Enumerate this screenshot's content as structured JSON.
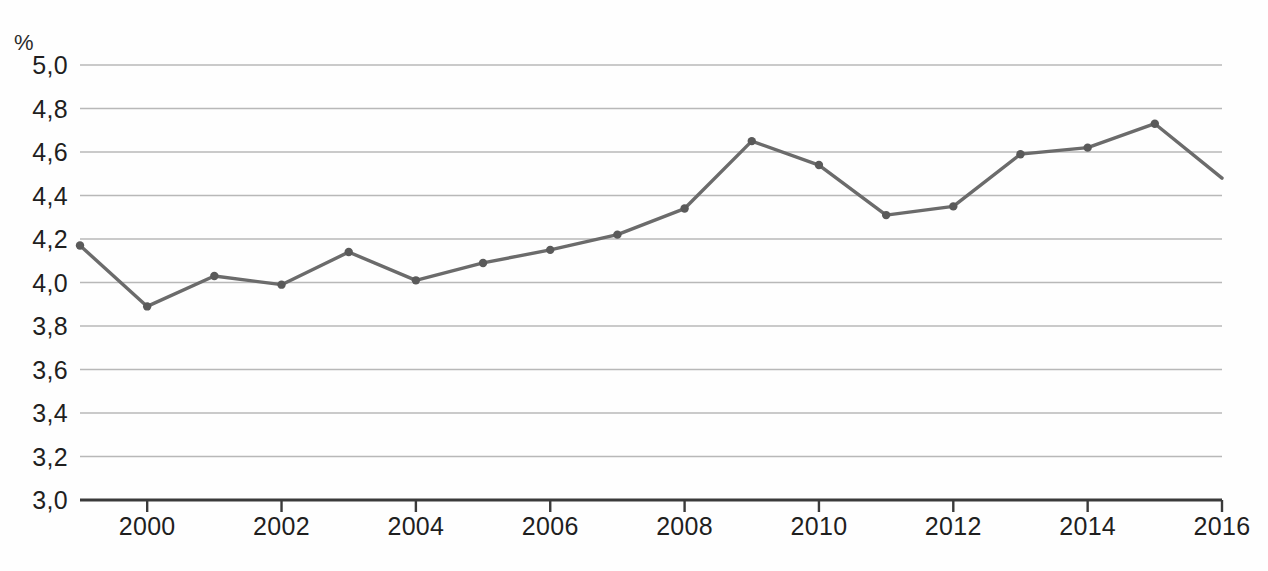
{
  "chart_data": {
    "type": "line",
    "title": "",
    "subtitle": "",
    "xlabel": "",
    "ylabel": "%",
    "unit_label": "%",
    "decimal_separator": ",",
    "grid": true,
    "legend": false,
    "legend_position": "none",
    "xlim": [
      1999,
      2016
    ],
    "ylim": [
      3.0,
      5.0
    ],
    "y_tick_step": 0.2,
    "x_tick_step": 2,
    "x": [
      1999,
      2000,
      2001,
      2002,
      2003,
      2004,
      2005,
      2006,
      2007,
      2008,
      2009,
      2010,
      2011,
      2012,
      2013,
      2014,
      2015,
      2016
    ],
    "values": [
      4.17,
      3.89,
      4.03,
      3.99,
      4.14,
      4.01,
      4.09,
      4.15,
      4.22,
      4.34,
      4.65,
      4.54,
      4.31,
      4.35,
      4.59,
      4.62,
      4.73,
      4.48
    ],
    "series": [
      {
        "name": "",
        "values": [
          4.17,
          3.89,
          4.03,
          3.99,
          4.14,
          4.01,
          4.09,
          4.15,
          4.22,
          4.34,
          4.65,
          4.54,
          4.31,
          4.35,
          4.59,
          4.62,
          4.73,
          4.48
        ]
      }
    ],
    "y_tick_labels": [
      "5,0",
      "4,8",
      "4,6",
      "4,4",
      "4,2",
      "4,0",
      "3,8",
      "3,6",
      "3,4",
      "3,2",
      "3,0"
    ],
    "y_tick_values": [
      5.0,
      4.8,
      4.6,
      4.4,
      4.2,
      4.0,
      3.8,
      3.6,
      3.4,
      3.2,
      3.0
    ],
    "x_tick_labels": [
      "2000",
      "2002",
      "2004",
      "2006",
      "2008",
      "2010",
      "2012",
      "2014",
      "2016"
    ],
    "x_tick_values": [
      2000,
      2002,
      2004,
      2006,
      2008,
      2010,
      2012,
      2014,
      2016
    ],
    "colors": {
      "line": "#6b6b6b",
      "marker": "#5a5a5a",
      "grid": "#b8b8b8",
      "axis": "#3a3a3a",
      "text": "#1f1f1f",
      "background": "#fefefe"
    }
  }
}
